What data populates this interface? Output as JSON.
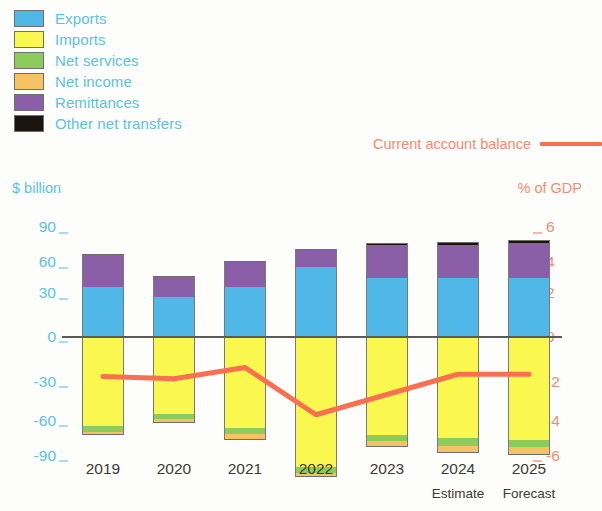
{
  "legend": {
    "items": [
      {
        "label": "Exports",
        "color": "#4FB8E8",
        "key": "exports"
      },
      {
        "label": "Imports",
        "color": "#FAF84F",
        "key": "imports"
      },
      {
        "label": "Net services",
        "color": "#8DCC5A",
        "key": "net_services"
      },
      {
        "label": "Net income",
        "color": "#F5C364",
        "key": "net_income"
      },
      {
        "label": "Remittances",
        "color": "#8B5FA8",
        "key": "remittances"
      },
      {
        "label": "Other net transfers",
        "color": "#1A1410",
        "key": "other_net_transfers"
      }
    ]
  },
  "line_legend": {
    "label": "Current account balance",
    "color": "#F96F52"
  },
  "axes": {
    "left_title": "$ billion",
    "right_title": "% of GDP",
    "left_ticks": [
      "90",
      "60",
      "30",
      "0",
      "-30",
      "-60",
      "-90"
    ],
    "right_ticks": [
      "6",
      "4",
      "2",
      "0",
      "-2",
      "-4",
      "-6"
    ],
    "left_color": "#5bc2e0",
    "right_color": "#f48c72"
  },
  "x_axis": {
    "labels": [
      "2019",
      "2020",
      "2021",
      "2022",
      "2023",
      "2024",
      "2025"
    ],
    "sublabels": [
      "",
      "",
      "",
      "",
      "",
      "Estimate",
      "Forecast"
    ]
  },
  "chart_data": {
    "type": "bar",
    "title": "",
    "subtitle": "",
    "xlabel": "",
    "ylabel": "$ billion",
    "y2label": "% of GDP",
    "ylim": [
      -90,
      90
    ],
    "y2lim": [
      -6,
      6
    ],
    "grid": false,
    "legend_position": "top-left",
    "stacked": true,
    "categories": [
      "2019",
      "2020",
      "2021",
      "2022",
      "2023",
      "2024",
      "2025"
    ],
    "series": [
      {
        "name": "Exports",
        "color": "#4FB8E8",
        "values": [
          33,
          26,
          33,
          46,
          39,
          39,
          39
        ]
      },
      {
        "name": "Imports",
        "color": "#FAF84F",
        "values": [
          -60,
          -52,
          -61,
          -87,
          -66,
          -68,
          -69
        ]
      },
      {
        "name": "Net services",
        "color": "#8DCC5A",
        "values": [
          -4,
          -3,
          -4,
          -4,
          -4,
          -5,
          -5
        ]
      },
      {
        "name": "Net income",
        "color": "#F5C364",
        "values": [
          -2,
          -3,
          -4,
          -3,
          -4,
          -5,
          -5
        ]
      },
      {
        "name": "Remittances",
        "color": "#8B5FA8",
        "values": [
          22,
          14,
          17,
          12,
          22,
          22,
          23
        ]
      },
      {
        "name": "Other net transfers",
        "color": "#1A1410",
        "values": [
          0,
          0,
          0,
          0,
          1,
          2,
          2
        ]
      }
    ],
    "overlay_line": {
      "name": "Current account balance",
      "color": "#F96F52",
      "axis": "right",
      "unit": "% of GDP",
      "values": [
        -1.8,
        -1.9,
        -1.4,
        -3.5,
        -2.6,
        -1.7,
        -1.7
      ]
    }
  }
}
